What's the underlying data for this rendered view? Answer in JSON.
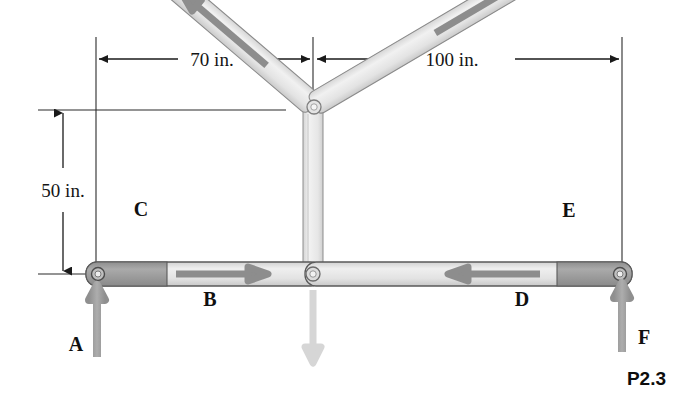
{
  "figure": {
    "caption": "P2.3",
    "background": "#ffffff"
  },
  "dimensions": {
    "horizontal_left": "70 in.",
    "horizontal_right": "100 in.",
    "vertical": "50 in."
  },
  "members": [
    {
      "id": "C",
      "label": "C",
      "type": "diagonal-left-chord",
      "arrow_direction": "down-left"
    },
    {
      "id": "E",
      "label": "E",
      "type": "diagonal-right-chord",
      "arrow_direction": "down-right"
    },
    {
      "id": "B",
      "label": "B",
      "type": "bottom-chord-left",
      "arrow_direction": "right"
    },
    {
      "id": "D",
      "label": "D",
      "type": "bottom-chord-right",
      "arrow_direction": "left"
    }
  ],
  "forces": [
    {
      "id": "A",
      "label": "A",
      "direction": "up",
      "location": "left-support"
    },
    {
      "id": "F",
      "label": "F",
      "direction": "up",
      "location": "right-support"
    },
    {
      "id": "P",
      "label": "",
      "direction": "down",
      "location": "bottom-center-joint"
    }
  ],
  "joints": [
    {
      "name": "left-support-pin"
    },
    {
      "name": "apex-pin"
    },
    {
      "name": "bottom-center-pin"
    },
    {
      "name": "right-support-pin"
    }
  ],
  "colors": {
    "member_light": "#e9e9e9",
    "member_dark": "#9a9a9a",
    "outline": "#4a4a4a",
    "arrow_force": "#9b9b9b",
    "arrow_force_light": "#d6d6d6",
    "arrow_member": "#8d8d8d",
    "dimension_line": "#1a1a1a",
    "text": "#111111"
  }
}
